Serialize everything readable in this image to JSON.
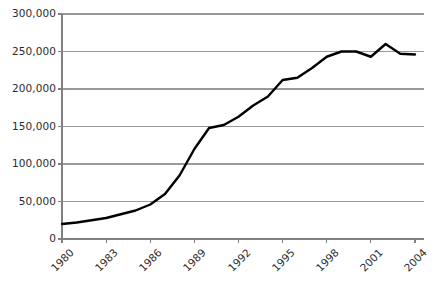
{
  "chart_data": {
    "type": "line",
    "title": "",
    "xlabel": "",
    "ylabel": "",
    "xlim": [
      1980,
      2004
    ],
    "ylim": [
      0,
      300000
    ],
    "grid": "horizontal",
    "legend": "none",
    "line_color": "#000000",
    "grid_color": "#999999",
    "axis_color": "#808080",
    "x_tick_labels": [
      "1980",
      "1983",
      "1986",
      "1989",
      "1992",
      "1995",
      "1998",
      "2001",
      "2004"
    ],
    "x_tick_values": [
      1980,
      1983,
      1986,
      1989,
      1992,
      1995,
      1998,
      2001,
      2004
    ],
    "y_tick_labels": [
      "0",
      "50,000",
      "100,000",
      "150,000",
      "200,000",
      "250,000",
      "300,000"
    ],
    "y_tick_values": [
      0,
      50000,
      100000,
      150000,
      200000,
      250000,
      300000
    ],
    "x": [
      1980,
      1981,
      1982,
      1983,
      1984,
      1985,
      1986,
      1987,
      1988,
      1989,
      1990,
      1991,
      1992,
      1993,
      1994,
      1995,
      1996,
      1997,
      1998,
      1999,
      2000,
      2001,
      2002,
      2003,
      2004
    ],
    "values": [
      20000,
      22000,
      25000,
      28000,
      33000,
      38000,
      46000,
      60000,
      85000,
      120000,
      148000,
      152000,
      163000,
      178000,
      190000,
      212000,
      215000,
      228000,
      243000,
      250000,
      250000,
      243000,
      260000,
      247000,
      246000
    ],
    "series": [
      {
        "name": "series-1",
        "values": [
          20000,
          22000,
          25000,
          28000,
          33000,
          38000,
          46000,
          60000,
          85000,
          120000,
          148000,
          152000,
          163000,
          178000,
          190000,
          212000,
          215000,
          228000,
          243000,
          250000,
          250000,
          243000,
          260000,
          247000,
          246000
        ]
      }
    ]
  }
}
